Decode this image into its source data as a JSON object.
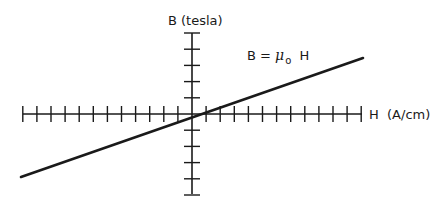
{
  "diagram": {
    "title": "B = μo H",
    "y_axis_label": "B  (tesla)",
    "x_axis_label": "H  (A/cm)",
    "equation": {
      "lhs": "B =",
      "mu": "μ",
      "subscript": "o",
      "rhs": "H"
    },
    "colors": {
      "ink": "#1a1a1a",
      "background": "#ffffff"
    }
  },
  "chart_data": {
    "type": "line",
    "title": "B = μo H",
    "xlabel": "H (A/cm)",
    "ylabel": "B (tesla)",
    "series": [
      {
        "name": "B = μo H",
        "x": [
          -12,
          12
        ],
        "y": [
          -4,
          3.4
        ]
      }
    ],
    "x_ticks_left": 12,
    "x_ticks_right": 12,
    "y_ticks_up": 5,
    "y_ticks_down": 5,
    "tick_labels": "none",
    "grid": false,
    "legend": "none"
  }
}
